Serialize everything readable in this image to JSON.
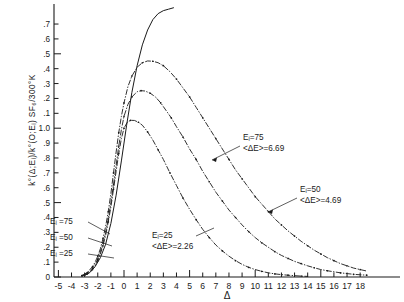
{
  "chart_data": {
    "type": "line",
    "title": "",
    "xlabel": "Δ",
    "ylabel": "k°(Δ;Eᵢ)/k°(O;Eᵢ) SF₆/300°K",
    "xlim": [
      -5.6,
      18.8
    ],
    "ylim": [
      0,
      1.78
    ],
    "grid": false,
    "legend_position": "inline-annotations",
    "xticks": [
      -5,
      -4,
      -3,
      -2,
      -1,
      0,
      1,
      2,
      3,
      4,
      5,
      6,
      7,
      8,
      9,
      10,
      11,
      12,
      13,
      14,
      15,
      16,
      17,
      18
    ],
    "xtick_labels": [
      "-5",
      "-4",
      "-3",
      "-2",
      "-1",
      "0",
      "1",
      "2",
      "3",
      "4",
      "5",
      "6",
      "7",
      "8",
      "9",
      "10",
      "11",
      "12",
      "13",
      "14",
      "15",
      "16",
      "17",
      "18"
    ],
    "yticks": [
      0,
      0.1,
      0.2,
      0.3,
      0.4,
      0.5,
      0.6,
      0.7,
      0.8,
      0.9,
      1.0,
      1.1,
      1.2,
      1.3,
      1.4,
      1.5,
      1.6,
      1.7
    ],
    "ytick_labels": [
      "0",
      ".1",
      ".2",
      ".3",
      ".4",
      ".5",
      ".6",
      ".7",
      ".8",
      ".9",
      "1.0",
      ".1",
      ".2",
      ".3",
      ".4",
      ".5",
      ".6",
      ".7"
    ],
    "series": [
      {
        "name": "E_i = 75",
        "style": "dash-dot-marker",
        "peak_x": 2.0,
        "peak_y": 1.45,
        "x": [
          -3.2,
          -3.0,
          -2.8,
          -2.6,
          -2.4,
          -2.2,
          -2.0,
          -1.8,
          -1.6,
          -1.4,
          -1.2,
          -1.0,
          -0.8,
          -0.6,
          -0.4,
          -0.2,
          0.0,
          0.3,
          0.6,
          1.0,
          1.4,
          1.8,
          2.2,
          2.6,
          3.0,
          3.5,
          4.0,
          4.5,
          5.0,
          5.5,
          6.0,
          6.5,
          7.0,
          7.5,
          8.0,
          8.5,
          9.0,
          9.5,
          10.0,
          10.5,
          11.0,
          11.5,
          12.0,
          12.5,
          13.0,
          13.5,
          14.0,
          14.5,
          15.0,
          15.5,
          16.0,
          16.5,
          17.0,
          17.5,
          18.0,
          18.5
        ],
        "y": [
          0.01,
          0.02,
          0.03,
          0.05,
          0.07,
          0.1,
          0.14,
          0.19,
          0.26,
          0.34,
          0.44,
          0.56,
          0.7,
          0.84,
          0.97,
          1.08,
          1.17,
          1.28,
          1.35,
          1.41,
          1.44,
          1.452,
          1.45,
          1.44,
          1.42,
          1.38,
          1.33,
          1.27,
          1.21,
          1.14,
          1.07,
          1.0,
          0.93,
          0.86,
          0.79,
          0.72,
          0.66,
          0.6,
          0.54,
          0.49,
          0.44,
          0.39,
          0.35,
          0.31,
          0.275,
          0.24,
          0.21,
          0.18,
          0.155,
          0.13,
          0.11,
          0.09,
          0.075,
          0.06,
          0.05,
          0.04
        ]
      },
      {
        "name": "E_i = 50",
        "style": "dash-dot-marker",
        "peak_x": 1.5,
        "peak_y": 1.25,
        "x": [
          -3.2,
          -3.0,
          -2.8,
          -2.6,
          -2.4,
          -2.2,
          -2.0,
          -1.8,
          -1.6,
          -1.4,
          -1.2,
          -1.0,
          -0.8,
          -0.6,
          -0.4,
          -0.2,
          0.0,
          0.3,
          0.6,
          1.0,
          1.3,
          1.6,
          2.0,
          2.4,
          2.8,
          3.2,
          3.6,
          4.0,
          4.5,
          5.0,
          5.5,
          6.0,
          6.5,
          7.0,
          7.5,
          8.0,
          8.5,
          9.0,
          9.5,
          10.0,
          10.5,
          11.0,
          11.5,
          12.0,
          12.5,
          13.0,
          13.5,
          14.0,
          14.5,
          15.0,
          15.5,
          16.0,
          16.5,
          17.0,
          17.5,
          18.0,
          18.5
        ],
        "y": [
          0.01,
          0.015,
          0.025,
          0.04,
          0.06,
          0.085,
          0.12,
          0.17,
          0.23,
          0.3,
          0.39,
          0.5,
          0.62,
          0.75,
          0.88,
          0.99,
          1.08,
          1.16,
          1.21,
          1.245,
          1.252,
          1.25,
          1.235,
          1.21,
          1.17,
          1.12,
          1.07,
          1.01,
          0.94,
          0.86,
          0.79,
          0.71,
          0.64,
          0.57,
          0.51,
          0.45,
          0.4,
          0.35,
          0.305,
          0.265,
          0.23,
          0.2,
          0.17,
          0.145,
          0.125,
          0.105,
          0.09,
          0.075,
          0.062,
          0.05,
          0.042,
          0.035,
          0.028,
          0.023,
          0.018,
          0.015,
          0.012
        ]
      },
      {
        "name": "E_i = 25",
        "style": "dash-dot-marker",
        "peak_x": 1.0,
        "peak_y": 1.05,
        "x": [
          -3.2,
          -3.0,
          -2.8,
          -2.6,
          -2.4,
          -2.2,
          -2.0,
          -1.8,
          -1.6,
          -1.4,
          -1.2,
          -1.0,
          -0.8,
          -0.6,
          -0.4,
          -0.2,
          0.0,
          0.25,
          0.5,
          0.8,
          1.1,
          1.4,
          1.8,
          2.2,
          2.6,
          3.0,
          3.5,
          4.0,
          4.5,
          5.0,
          5.5,
          6.0,
          6.5,
          7.0,
          7.5,
          8.0,
          8.5,
          9.0,
          9.5,
          10.0,
          10.5,
          11.0,
          11.5,
          12.0,
          12.5,
          13.0,
          13.5,
          14.0
        ],
        "y": [
          0.008,
          0.012,
          0.02,
          0.032,
          0.05,
          0.075,
          0.11,
          0.155,
          0.21,
          0.28,
          0.37,
          0.47,
          0.59,
          0.71,
          0.83,
          0.93,
          1.0,
          1.04,
          1.053,
          1.052,
          1.04,
          1.02,
          0.975,
          0.92,
          0.855,
          0.79,
          0.7,
          0.615,
          0.53,
          0.455,
          0.385,
          0.32,
          0.265,
          0.215,
          0.175,
          0.14,
          0.11,
          0.085,
          0.065,
          0.05,
          0.038,
          0.028,
          0.021,
          0.016,
          0.012,
          0.009,
          0.006,
          0.004
        ]
      },
      {
        "name": "solid-reference-curve",
        "style": "solid",
        "x": [
          -3.0,
          -2.6,
          -2.2,
          -1.8,
          -1.4,
          -1.0,
          -0.6,
          -0.2,
          0.2,
          0.6,
          1.0,
          1.4,
          1.8,
          2.2,
          2.6,
          3.0,
          3.4,
          3.8
        ],
        "y": [
          0.01,
          0.03,
          0.07,
          0.13,
          0.22,
          0.36,
          0.55,
          0.78,
          1.02,
          1.24,
          1.42,
          1.56,
          1.66,
          1.73,
          1.77,
          1.79,
          1.8,
          1.81
        ]
      }
    ],
    "annotations": [
      {
        "name": "annot-ei75",
        "line1": "Eᵢ=75",
        "line2": "<ΔE>=6.69",
        "x_px": 243,
        "y_px": 140
      },
      {
        "name": "annot-ei50",
        "line1": "Eᵢ=50",
        "line2": "<ΔE>=4.69",
        "x_px": 300,
        "y_px": 192
      },
      {
        "name": "annot-ei25",
        "line1": "Eᵢ=25",
        "line2": "<ΔE>=2.26",
        "x_px": 152,
        "y_px": 238
      }
    ],
    "left_labels": [
      {
        "name": "left-label-ei75",
        "text": "Eᵢ =75",
        "x_px": 50,
        "y_px": 224
      },
      {
        "name": "left-label-ei50",
        "text": "Eᵢ =50",
        "x_px": 50,
        "y_px": 240
      },
      {
        "name": "left-label-ei25",
        "text": "Eᵢ =25",
        "x_px": 50,
        "y_px": 256
      }
    ]
  },
  "axis_title": {
    "y_main": "k°(Δ;Eᵢ)/k°(O;Eᵢ) SF₆/300°K",
    "x_main": "Δ"
  }
}
